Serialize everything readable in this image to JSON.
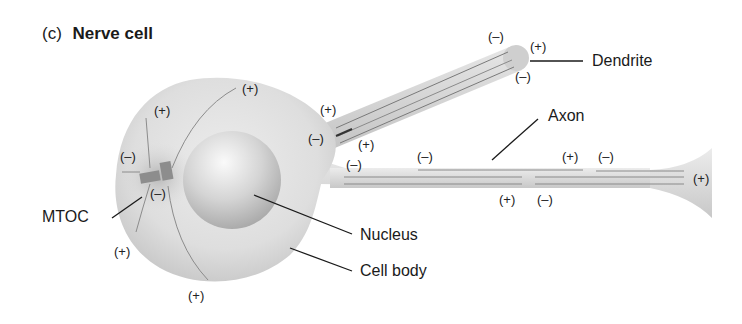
{
  "figure": {
    "panel_letter": "(c)",
    "title": "Nerve cell"
  },
  "labels": {
    "dendrite": "Dendrite",
    "axon": "Axon",
    "mtoc": "MTOC",
    "nucleus": "Nucleus",
    "cell_body": "Cell body"
  },
  "polarity": {
    "plus": "(+)",
    "minus": "(–)"
  },
  "polarity_marks": [
    {
      "id": "body-top-left",
      "sign": "(+)"
    },
    {
      "id": "body-top",
      "sign": "(+)"
    },
    {
      "id": "mtoc-upper",
      "sign": "(–)"
    },
    {
      "id": "mtoc-lower",
      "sign": "(–)"
    },
    {
      "id": "body-bottom-left",
      "sign": "(+)"
    },
    {
      "id": "body-bottom",
      "sign": "(+)"
    },
    {
      "id": "dendrite-base-plus",
      "sign": "(+)"
    },
    {
      "id": "dendrite-base-minus",
      "sign": "(–)"
    },
    {
      "id": "dendrite-tip-minus-top",
      "sign": "(–)"
    },
    {
      "id": "dendrite-tip-plus",
      "sign": "(+)"
    },
    {
      "id": "dendrite-tip-minus-bottom",
      "sign": "(–)"
    },
    {
      "id": "axon-hillock-plus",
      "sign": "(+)"
    },
    {
      "id": "axon-hillock-minus",
      "sign": "(–)"
    },
    {
      "id": "axon-upper-minus-1",
      "sign": "(–)"
    },
    {
      "id": "axon-upper-plus",
      "sign": "(+)"
    },
    {
      "id": "axon-upper-minus-2",
      "sign": "(–)"
    },
    {
      "id": "axon-lower-plus",
      "sign": "(+)"
    },
    {
      "id": "axon-lower-minus",
      "sign": "(–)"
    },
    {
      "id": "axon-terminal-plus",
      "sign": "(+)"
    }
  ]
}
